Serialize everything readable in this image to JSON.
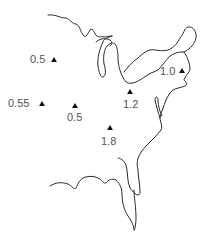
{
  "map": {
    "region": "Eastern United States",
    "marker_shape": "triangle",
    "colors": {
      "coastline": "#2a2a2a",
      "marker": "#111111",
      "label": "#555555",
      "background": "#ffffff"
    },
    "points": [
      {
        "id": "p1",
        "value": "0.5",
        "x": 54,
        "y": 60,
        "label_x": 30,
        "label_y": 63,
        "anchor": "start"
      },
      {
        "id": "p2",
        "value": "0.55",
        "x": 42,
        "y": 104,
        "label_x": 8,
        "label_y": 107,
        "anchor": "start"
      },
      {
        "id": "p3",
        "value": "0.5",
        "x": 75,
        "y": 106,
        "label_x": 67,
        "label_y": 121,
        "anchor": "start"
      },
      {
        "id": "p4",
        "value": "1.2",
        "x": 130,
        "y": 92,
        "label_x": 123,
        "label_y": 108,
        "anchor": "start"
      },
      {
        "id": "p5",
        "value": "1.8",
        "x": 110,
        "y": 128,
        "label_x": 101,
        "label_y": 145,
        "anchor": "start"
      },
      {
        "id": "p6",
        "value": "1.0",
        "x": 182,
        "y": 71,
        "label_x": 160,
        "label_y": 75,
        "anchor": "start"
      }
    ]
  }
}
